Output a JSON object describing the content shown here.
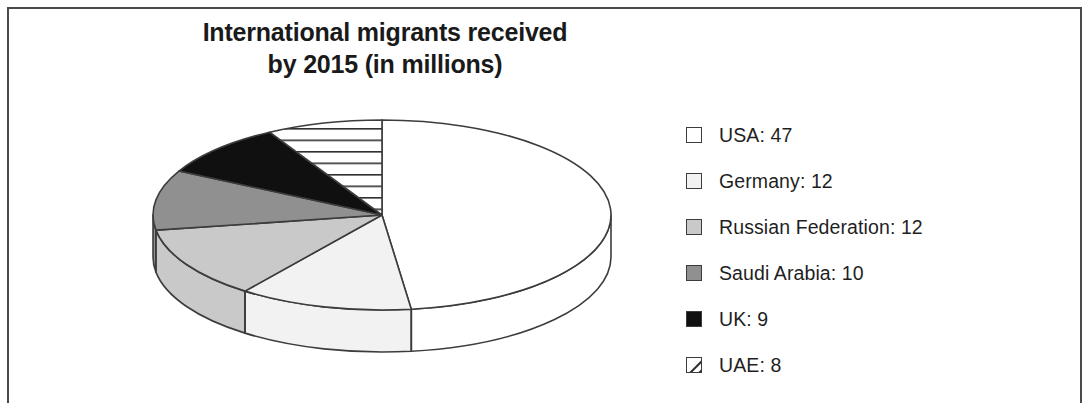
{
  "chart_data": {
    "type": "pie",
    "title": "International migrants received by 2015 (in millions)",
    "title_lines": [
      "International migrants received",
      "by 2015 (in millions)"
    ],
    "unit": "millions",
    "legend_position": "right",
    "grid": false,
    "three_d": true,
    "categories": [
      "USA",
      "Germany",
      "Russian Federation",
      "Saudi Arabia",
      "UK",
      "UAE"
    ],
    "values": [
      47,
      12,
      12,
      10,
      9,
      8
    ],
    "legend_entries": [
      {
        "label": "USA: 47",
        "name": "USA",
        "value": 47,
        "swatch": "solid",
        "color": "#ffffff"
      },
      {
        "label": "Germany: 12",
        "name": "Germany",
        "value": 12,
        "swatch": "solid",
        "color": "#f2f2f2"
      },
      {
        "label": "Russian Federation: 12",
        "name": "Russian Federation",
        "value": 12,
        "swatch": "solid",
        "color": "#c9c9c9"
      },
      {
        "label": "Saudi Arabia: 10",
        "name": "Saudi Arabia",
        "value": 10,
        "swatch": "solid",
        "color": "#909090"
      },
      {
        "label": "UK: 9",
        "name": "UK",
        "value": 9,
        "swatch": "solid",
        "color": "#101010"
      },
      {
        "label": "UAE: 8",
        "name": "UAE",
        "value": 8,
        "swatch": "diagonal-hatch",
        "color": "#ffffff"
      }
    ],
    "slice_colors": [
      "#ffffff",
      "#f2f2f2",
      "#c9c9c9",
      "#909090",
      "#101010",
      "#ffffff"
    ],
    "slice_patterns": [
      "solid",
      "solid",
      "solid",
      "solid",
      "solid",
      "horizontal-hatch"
    ],
    "outline_color": "#3c3c3c",
    "frame_color": "#4a4a4a",
    "background": "#ffffff"
  },
  "legend": {
    "rows": [
      {
        "label": "USA: 47"
      },
      {
        "label": "Germany: 12"
      },
      {
        "label": "Russian Federation: 12"
      },
      {
        "label": "Saudi Arabia: 10"
      },
      {
        "label": "UK: 9"
      },
      {
        "label": "UAE: 8"
      }
    ]
  },
  "title": {
    "line1": "International migrants received",
    "line2": "by 2015 (in millions)"
  }
}
